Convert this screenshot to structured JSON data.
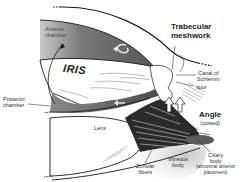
{
  "diagram": {
    "labels": {
      "anterior_chamber": "Anterior\nchamber",
      "anterior_chamber_l1": "Anterior",
      "anterior_chamber_l2": "chamber",
      "trabecular_l1": "Trabecular",
      "trabecular_l2": "meshwork",
      "canal_l1": "Canal of",
      "canal_l2": "Schlemm",
      "spur": "spur",
      "iris": "IRIS",
      "posterior_l1": "Posterior",
      "posterior_l2": "chamber",
      "angle": "Angle",
      "angle_sub": "(closed)",
      "lens": "Lens",
      "zonular_l1": "Zonular",
      "zonular_l2": "fibers",
      "vitreous_l1": "Vitreous",
      "vitreous_l2": "body",
      "ciliary_l1": "Ciliary",
      "ciliary_l2": "body",
      "ciliary_l3": "(abnormal anterior",
      "ciliary_l4": "placement)"
    },
    "colors": {
      "chamber_fill": "#6e6e6e",
      "chamber_light": "#b5b5b5",
      "outline": "#1a1a1a",
      "tissue_white": "#ffffff",
      "fiber_dark": "#2b2b2b"
    }
  }
}
